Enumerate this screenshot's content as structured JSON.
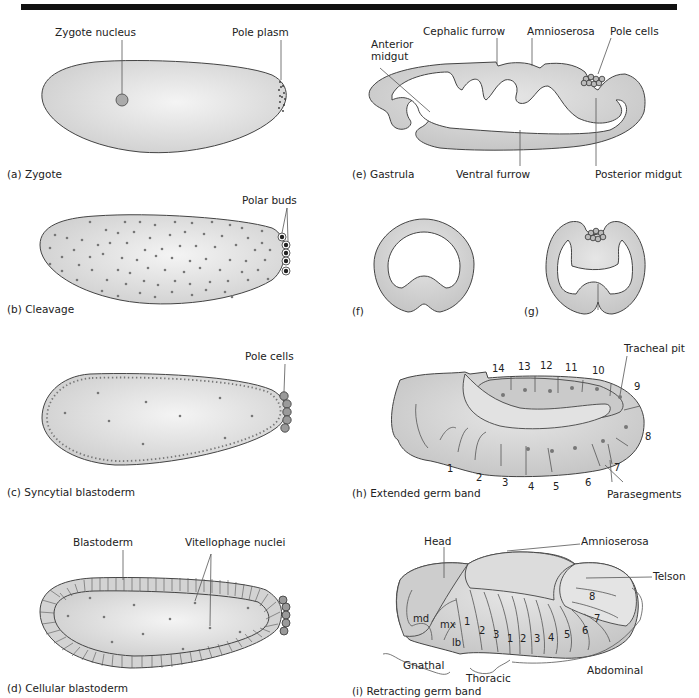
{
  "figure": {
    "panels": [
      {
        "id": "a",
        "caption": "(a)  Zygote",
        "labels": [
          "Zygote nucleus",
          "Pole plasm"
        ]
      },
      {
        "id": "b",
        "caption": "(b)  Cleavage",
        "labels": [
          "Polar buds"
        ]
      },
      {
        "id": "c",
        "caption": "(c)  Syncytial blastoderm",
        "labels": [
          "Pole cells"
        ]
      },
      {
        "id": "d",
        "caption": "(d)  Cellular blastoderm",
        "labels": [
          "Blastoderm",
          "Vitellophage nuclei"
        ]
      },
      {
        "id": "e",
        "caption": "(e)  Gastrula",
        "labels": [
          "Cephalic furrow",
          "Amnioserosa",
          "Pole cells",
          "Anterior",
          "midgut",
          "Ventral furrow",
          "Posterior midgut"
        ]
      },
      {
        "id": "f",
        "caption": "(f)",
        "labels": []
      },
      {
        "id": "g",
        "caption": "(g)",
        "labels": []
      },
      {
        "id": "h",
        "caption": "(h)  Extended germ band",
        "labels": [
          "Tracheal pit",
          "Parasegments"
        ],
        "segment_numbers": [
          "1",
          "2",
          "3",
          "4",
          "5",
          "6",
          "7",
          "8",
          "9",
          "10",
          "11",
          "12",
          "13",
          "14"
        ]
      },
      {
        "id": "i",
        "caption": "(i)  Retracting germ band",
        "labels": [
          "Head",
          "Amnioserosa",
          "Telson",
          "Gnathal",
          "Thoracic",
          "Abdominal"
        ],
        "gnathal_segments": [
          "md",
          "mx",
          "lb"
        ],
        "thoracic_segments": [
          "1",
          "2",
          "3"
        ],
        "abdominal_segments": [
          "1",
          "2",
          "3",
          "4",
          "5",
          "6",
          "7",
          "8"
        ]
      }
    ]
  },
  "colors": {
    "tissue": "#d3d3d3",
    "outline": "#444444",
    "background": "#ffffff",
    "rule": "#111111"
  }
}
